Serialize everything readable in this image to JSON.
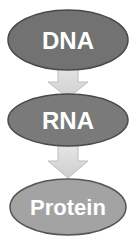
{
  "diagram": {
    "nodes": [
      {
        "id": "dna",
        "label": "DNA",
        "color": "#727272"
      },
      {
        "id": "rna",
        "label": "RNA",
        "color": "#7a7a7a"
      },
      {
        "id": "protein",
        "label": "Protein",
        "color": "#a3a3a3"
      }
    ],
    "edges": [
      {
        "from": "dna",
        "to": "rna",
        "icon": "down-arrow-icon",
        "color": "#d6d6d6"
      },
      {
        "from": "rna",
        "to": "protein",
        "icon": "down-arrow-icon",
        "color": "#d6d6d6"
      }
    ]
  }
}
